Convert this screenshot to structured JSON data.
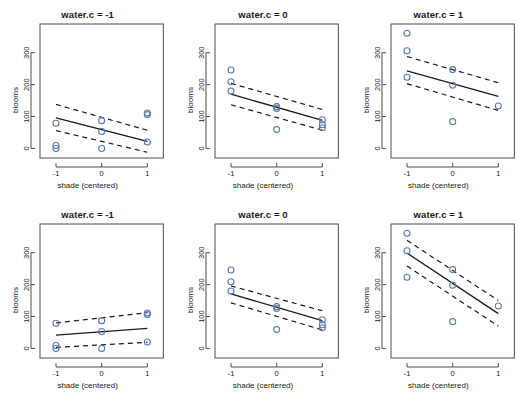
{
  "figure": {
    "type": "multi-panel-regression-grid",
    "rows": 2,
    "cols": 3,
    "background": "#ffffff",
    "point_color": "#5b79ab",
    "line_color": "#1a1a1a",
    "frame_color": "#4d4d4d",
    "caption": ""
  },
  "axes": {
    "xlabel": "shade (centered)",
    "ylabel": "blooms",
    "xticks": [
      "-1",
      "0",
      "1"
    ],
    "xtick_values": [
      -1,
      0,
      1
    ],
    "yticks": [
      "0",
      "100",
      "200",
      "300"
    ],
    "ytick_values": [
      0,
      100,
      200,
      300
    ],
    "xlim": [
      -1.35,
      1.35
    ],
    "ylim": [
      -30,
      390
    ],
    "grid": false
  },
  "chart_data": {
    "type": "scatter",
    "title": "",
    "xlabel": "shade (centered)",
    "ylabel": "blooms",
    "xlim": [
      -1.35,
      1.35
    ],
    "ylim": [
      -30,
      390
    ],
    "grid": false,
    "legend": "none",
    "panels": [
      {
        "row": 0,
        "col": 0,
        "title": "water.c = -1",
        "model": "no-interaction",
        "points": [
          {
            "x": -1,
            "y": 0
          },
          {
            "x": -1,
            "y": 9
          },
          {
            "x": -1,
            "y": 79
          },
          {
            "x": 0,
            "y": 0
          },
          {
            "x": 0,
            "y": 53
          },
          {
            "x": 0,
            "y": 87
          },
          {
            "x": 1,
            "y": 20
          },
          {
            "x": 1,
            "y": 106
          },
          {
            "x": 1,
            "y": 111
          }
        ],
        "fit": {
          "x": [
            -1,
            1
          ],
          "y": [
            96,
            22
          ]
        },
        "upper": {
          "x": [
            -1,
            1
          ],
          "y": [
            138,
            57
          ]
        },
        "lower": {
          "x": [
            -1,
            1
          ],
          "y": [
            56,
            -12
          ]
        }
      },
      {
        "row": 0,
        "col": 1,
        "title": "water.c = 0",
        "model": "no-interaction",
        "points": [
          {
            "x": -1,
            "y": 180
          },
          {
            "x": -1,
            "y": 209
          },
          {
            "x": -1,
            "y": 246
          },
          {
            "x": 0,
            "y": 59
          },
          {
            "x": 0,
            "y": 125
          },
          {
            "x": 0,
            "y": 131
          },
          {
            "x": 1,
            "y": 65
          },
          {
            "x": 1,
            "y": 74
          },
          {
            "x": 1,
            "y": 90
          }
        ],
        "fit": {
          "x": [
            -1,
            1
          ],
          "y": [
            170,
            88
          ]
        },
        "upper": {
          "x": [
            -1,
            1
          ],
          "y": [
            204,
            122
          ]
        },
        "lower": {
          "x": [
            -1,
            1
          ],
          "y": [
            137,
            57
          ]
        }
      },
      {
        "row": 0,
        "col": 2,
        "title": "water.c = 1",
        "model": "no-interaction",
        "points": [
          {
            "x": -1,
            "y": 223
          },
          {
            "x": -1,
            "y": 306
          },
          {
            "x": -1,
            "y": 361
          },
          {
            "x": 0,
            "y": 84
          },
          {
            "x": 0,
            "y": 198
          },
          {
            "x": 0,
            "y": 247
          },
          {
            "x": 1,
            "y": 133
          }
        ],
        "fit": {
          "x": [
            -1,
            1
          ],
          "y": [
            243,
            163
          ]
        },
        "upper": {
          "x": [
            -1,
            1
          ],
          "y": [
            288,
            206
          ]
        },
        "lower": {
          "x": [
            -1,
            1
          ],
          "y": [
            203,
            119
          ]
        }
      },
      {
        "row": 1,
        "col": 0,
        "title": "water.c = -1",
        "model": "interaction",
        "points": [
          {
            "x": -1,
            "y": 0
          },
          {
            "x": -1,
            "y": 9
          },
          {
            "x": -1,
            "y": 79
          },
          {
            "x": 0,
            "y": 0
          },
          {
            "x": 0,
            "y": 53
          },
          {
            "x": 0,
            "y": 87
          },
          {
            "x": 1,
            "y": 20
          },
          {
            "x": 1,
            "y": 106
          },
          {
            "x": 1,
            "y": 111
          }
        ],
        "fit": {
          "x": [
            -1,
            1
          ],
          "y": [
            42,
            63
          ]
        },
        "upper": {
          "x": [
            -1,
            1
          ],
          "y": [
            80,
            112
          ]
        },
        "lower": {
          "x": [
            -1,
            1
          ],
          "y": [
            3,
            19
          ]
        }
      },
      {
        "row": 1,
        "col": 1,
        "title": "water.c = 0",
        "model": "interaction",
        "points": [
          {
            "x": -1,
            "y": 180
          },
          {
            "x": -1,
            "y": 209
          },
          {
            "x": -1,
            "y": 246
          },
          {
            "x": 0,
            "y": 59
          },
          {
            "x": 0,
            "y": 125
          },
          {
            "x": 0,
            "y": 131
          },
          {
            "x": 1,
            "y": 65
          },
          {
            "x": 1,
            "y": 74
          },
          {
            "x": 1,
            "y": 90
          }
        ],
        "fit": {
          "x": [
            -1,
            1
          ],
          "y": [
            171,
            87
          ]
        },
        "upper": {
          "x": [
            -1,
            1
          ],
          "y": [
            196,
            118
          ]
        },
        "lower": {
          "x": [
            -1,
            1
          ],
          "y": [
            143,
            58
          ]
        }
      },
      {
        "row": 1,
        "col": 2,
        "title": "water.c = 1",
        "model": "interaction",
        "points": [
          {
            "x": -1,
            "y": 223
          },
          {
            "x": -1,
            "y": 306
          },
          {
            "x": -1,
            "y": 361
          },
          {
            "x": 0,
            "y": 84
          },
          {
            "x": 0,
            "y": 198
          },
          {
            "x": 0,
            "y": 247
          },
          {
            "x": 1,
            "y": 133
          }
        ],
        "fit": {
          "x": [
            -1,
            1
          ],
          "y": [
            299,
            109
          ]
        },
        "upper": {
          "x": [
            -1,
            1
          ],
          "y": [
            339,
            150
          ]
        },
        "lower": {
          "x": [
            -1,
            1
          ],
          "y": [
            258,
            70
          ]
        }
      }
    ]
  }
}
